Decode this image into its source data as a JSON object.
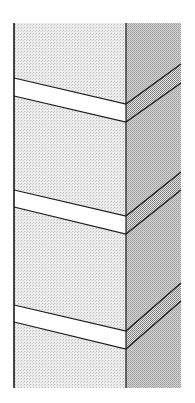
{
  "diagram": {
    "type": "isometric-column-with-bands",
    "canvas": {
      "width": 195,
      "height": 403
    },
    "colors": {
      "background": "#ffffff",
      "front_face": "#e4e4e4",
      "side_face": "#c4c4c4",
      "band_front": "#ffffff",
      "band_side": "#b8b8b8",
      "stroke": "#1a1a1a"
    },
    "column": {
      "left_x": 14,
      "corner_x": 126,
      "right_x": 181,
      "top_y": 23,
      "bottom_y": 388
    },
    "bands": [
      {
        "left_top": 78,
        "left_bottom": 96,
        "corner_top": 104,
        "corner_bottom": 122,
        "right_top": 64,
        "right_bottom": 83
      },
      {
        "left_top": 190,
        "left_bottom": 207,
        "corner_top": 216,
        "corner_bottom": 234,
        "right_top": 172,
        "right_bottom": 190
      },
      {
        "left_top": 305,
        "left_bottom": 322,
        "corner_top": 331,
        "corner_bottom": 349,
        "right_top": 283,
        "right_bottom": 301
      }
    ]
  }
}
